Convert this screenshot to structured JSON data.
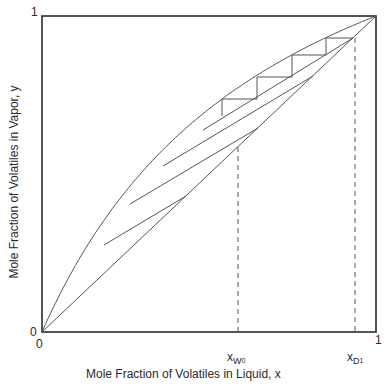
{
  "chart_data": {
    "type": "line",
    "title": "",
    "xlabel": "Mole Fraction of Volatiles in Liquid, x",
    "ylabel": "Mole Fraction of Volatiles in Vapor, y",
    "xlim": [
      0,
      1
    ],
    "ylim": [
      0,
      1
    ],
    "grid": false,
    "x_tick_labels": [
      "0",
      "1"
    ],
    "y_tick_labels": [
      "0",
      "1"
    ],
    "annotations": [
      {
        "text": "x_W0",
        "x": 0.587
      },
      {
        "text": "x_D1",
        "x": 0.93
      }
    ],
    "series": [
      {
        "name": "equilibrium curve",
        "relative_volatility": 2.4,
        "x": [
          0,
          0.1,
          0.2,
          0.3,
          0.4,
          0.5,
          0.6,
          0.7,
          0.8,
          0.9,
          1.0
        ],
        "y": [
          0,
          0.21,
          0.375,
          0.507,
          0.615,
          0.706,
          0.783,
          0.848,
          0.906,
          0.956,
          1.0
        ]
      },
      {
        "name": "45-degree line",
        "x": [
          0,
          1
        ],
        "y": [
          0,
          1
        ]
      },
      {
        "name": "operating line 1",
        "x": [
          0.186,
          0.431
        ],
        "y": [
          0.275,
          0.431
        ]
      },
      {
        "name": "operating line 2",
        "x": [
          0.263,
          0.647
        ],
        "y": [
          0.405,
          0.646
        ]
      },
      {
        "name": "operating line 3",
        "x": [
          0.362,
          0.811
        ],
        "y": [
          0.525,
          0.81
        ]
      },
      {
        "name": "operating line 4 (stepped)",
        "x": [
          0.482,
          0.931
        ],
        "y": [
          0.639,
          0.93
        ]
      },
      {
        "name": "stage steps",
        "x": [
          0.931,
          0.85,
          0.85,
          0.749,
          0.749,
          0.644,
          0.644,
          0.539,
          0.539
        ],
        "y": [
          0.93,
          0.93,
          0.88,
          0.88,
          0.813,
          0.813,
          0.741,
          0.741,
          0.684
        ]
      },
      {
        "name": "x_W0 dashed",
        "x": [
          0.587,
          0.587
        ],
        "y": [
          0,
          0.587
        ]
      },
      {
        "name": "x_D1 dashed",
        "x": [
          0.93,
          0.93
        ],
        "y": [
          0,
          0.93
        ]
      }
    ]
  },
  "labels": {
    "y_top": "1",
    "y_origin": "0",
    "x_origin": "0",
    "x_right": "1",
    "xw_main": "x",
    "xw_sub": "W",
    "xw_subsub": "0",
    "xd_main": "x",
    "xd_sub": "D",
    "xd_subsub": "1",
    "xlabel": "Mole Fraction of Volatiles in Liquid, x",
    "ylabel": "Mole Fraction of Volatiles in Vapor, y"
  },
  "colors": {
    "line": "#555555",
    "frame": "#2a2a2a"
  }
}
